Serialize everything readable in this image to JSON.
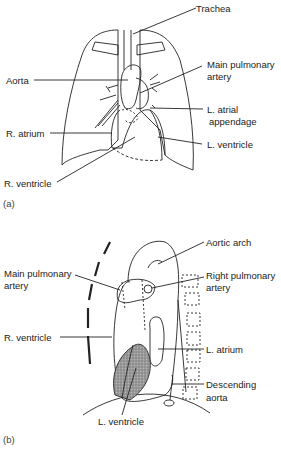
{
  "figure_a": {
    "panel_label": "(a)",
    "labels": {
      "trachea": "Trachea",
      "aorta": "Aorta",
      "main_pulmonary_artery_1": "Main pulmonary",
      "main_pulmonary_artery_2": "artery",
      "l_atrial_appendage_1": "L. atrial",
      "l_atrial_appendage_2": "appendage",
      "r_atrium": "R. atrium",
      "l_ventricle": "L. ventricle",
      "r_ventricle": "R. ventricle"
    }
  },
  "figure_b": {
    "panel_label": "(b)",
    "labels": {
      "aortic_arch": "Aortic arch",
      "main_pulmonary_artery_1": "Main pulmonary",
      "main_pulmonary_artery_2": "artery",
      "right_pulmonary_artery_1": "Right pulmonary",
      "right_pulmonary_artery_2": "artery",
      "r_ventricle": "R. ventricle",
      "l_atrium": "L. atrium",
      "descending_aorta_1": "Descending",
      "descending_aorta_2": "aorta",
      "l_ventricle": "L. ventricle"
    }
  }
}
